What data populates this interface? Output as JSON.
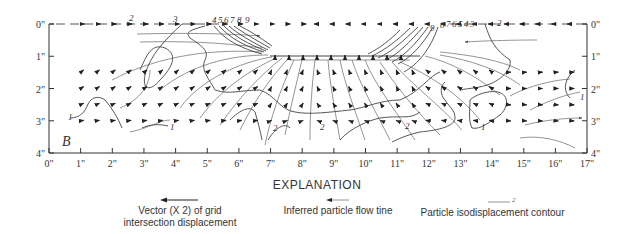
{
  "figure": {
    "panel_label": "B",
    "x_ticks": [
      "0\"",
      "1\"",
      "2\"",
      "3\"",
      "4\"",
      "5\"",
      "6\"",
      "7\"",
      "8\"",
      "9\"",
      "10\"",
      "11\"",
      "12\"",
      "13\"",
      "14\"",
      "15\"",
      "16\"",
      "17\""
    ],
    "y_ticks_left": [
      "0\"",
      "1\"",
      "2\"",
      "3\"",
      "4\""
    ],
    "y_ticks_right": [
      "0\"",
      "1\"",
      "2\"",
      "3\"",
      "4\""
    ],
    "contour_labels_left": [
      "4",
      "5",
      "6",
      "7",
      "8",
      "9"
    ],
    "contour_labels_right": [
      "9",
      "8",
      "7",
      "6",
      "5",
      "4",
      "3"
    ],
    "contour_labels_misc": [
      "2",
      "3",
      "2",
      "2",
      "2",
      "2",
      "1",
      "1",
      "1",
      "1"
    ],
    "colors": {
      "ink": "#222222",
      "flow_line": "#888888",
      "contour": "#444444",
      "background": "#ffffff"
    }
  },
  "explanation": {
    "title": "EXPLANATION",
    "items": [
      {
        "label_line1": "Vector (X 2) of grid",
        "label_line2": "intersection displacement",
        "symbol": "arrow-left-long"
      },
      {
        "label_line1": "Inferred particle flow tine",
        "label_line2": "",
        "symbol": "arrow-left-thin"
      },
      {
        "label_line1": "Particle isodisplacement contour",
        "label_line2": "",
        "symbol": "contour-line",
        "symbol_label": "2"
      }
    ]
  }
}
